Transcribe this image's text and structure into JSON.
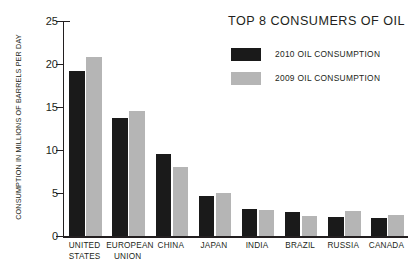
{
  "chart_data": {
    "type": "bar",
    "title": "TOP 8 CONSUMERS OF OIL",
    "xlabel": "",
    "ylabel": "CONSUMPTION IN MILLIONS OF BARRELS PER DAY",
    "ylim": [
      0,
      25
    ],
    "yticks": [
      0,
      5,
      10,
      15,
      20,
      25
    ],
    "ytick_labels": [
      "0",
      "5",
      "10",
      "15",
      "20",
      "25"
    ],
    "grid": false,
    "legend_position": "top-right",
    "categories": [
      "UNITED STATES",
      "EUROPEAN UNION",
      "CHINA",
      "JAPAN",
      "INDIA",
      "BRAZIL",
      "RUSSIA",
      "CANADA"
    ],
    "category_lines": [
      [
        "UNITED",
        "STATES"
      ],
      [
        "EUROPEAN",
        "UNION"
      ],
      [
        "CHINA",
        ""
      ],
      [
        "JAPAN",
        ""
      ],
      [
        "INDIA",
        ""
      ],
      [
        "BRAZIL",
        ""
      ],
      [
        "RUSSIA",
        ""
      ],
      [
        "CANADA",
        ""
      ]
    ],
    "series": [
      {
        "name": "2010 OIL CONSUMPTION",
        "color": "#1a1a1a",
        "values": [
          19.2,
          13.7,
          9.5,
          4.6,
          3.1,
          2.8,
          2.2,
          2.1
        ]
      },
      {
        "name": "2009 OIL CONSUMPTION",
        "color": "#b5b5b5",
        "values": [
          20.8,
          14.5,
          8.0,
          5.0,
          3.0,
          2.3,
          2.9,
          2.5
        ]
      }
    ]
  },
  "legend": [
    {
      "label": "2010 OIL CONSUMPTION",
      "color": "#1a1a1a"
    },
    {
      "label": "2009 OIL CONSUMPTION",
      "color": "#b5b5b5"
    }
  ]
}
